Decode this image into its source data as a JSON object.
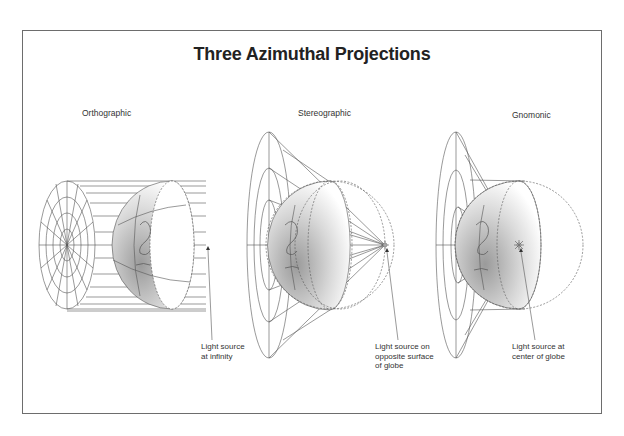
{
  "figure": {
    "title": "Three Azimuthal Projections",
    "colors": {
      "line": "#555555",
      "frame": "#6d6d6d",
      "shade": "#bdbdbd",
      "text": "#333333"
    }
  },
  "panels": [
    {
      "name": "Orthographic",
      "caption": [
        "Light source",
        "at infinity"
      ],
      "light_source": "infinity"
    },
    {
      "name": "Stereographic",
      "caption": [
        "Light source on",
        "opposite surface",
        "of globe"
      ],
      "light_source": "opposite surface of globe"
    },
    {
      "name": "Gnomonic",
      "caption": [
        "Light source at",
        "center of globe"
      ],
      "light_source": "center of globe"
    }
  ]
}
